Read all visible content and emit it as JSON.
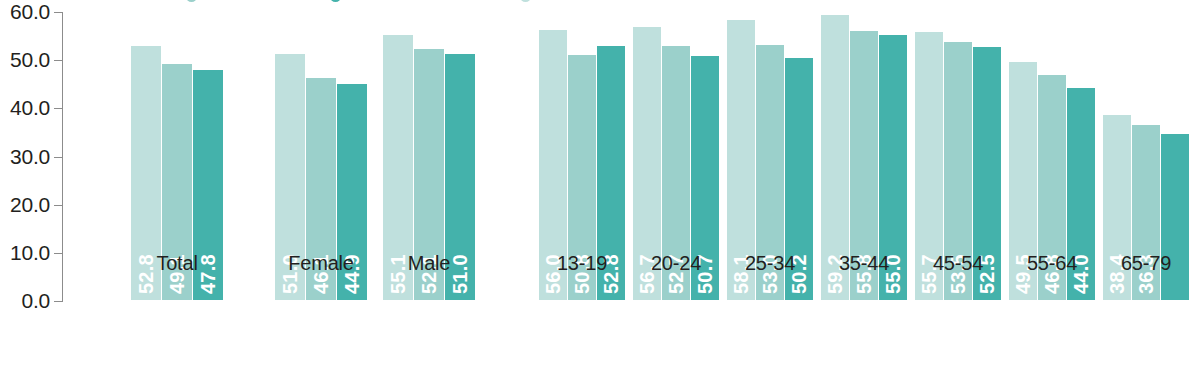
{
  "chart_data": {
    "type": "bar",
    "title": "",
    "xlabel": "",
    "ylabel": "",
    "ylim": [
      0,
      60
    ],
    "grid": false,
    "legend_position": "top",
    "y_ticks": [
      "0.0",
      "10.0",
      "20.0",
      "30.0",
      "40.0",
      "50.0",
      "60.0"
    ],
    "y_tick_values": [
      0,
      10,
      20,
      30,
      40,
      50,
      60
    ],
    "categories": [
      "Total",
      "Female",
      "Male",
      "13-19",
      "20-24",
      "25-34",
      "35-44",
      "45-54",
      "55-64",
      "65-79"
    ],
    "series": [
      {
        "name": "series-1",
        "color": "#bfe0dd",
        "values": [
          52.8,
          51.0,
          55.1,
          56.0,
          56.7,
          58.1,
          59.2,
          55.7,
          49.5,
          38.4
        ],
        "labels": [
          "52.8",
          "51.0",
          "55.1",
          "56.0",
          "56.7",
          "58.1",
          "59.2",
          "55.7",
          "49.5",
          "38.4"
        ]
      },
      {
        "name": "series-2",
        "color": "#9bd0cb",
        "values": [
          49.1,
          46.1,
          52.1,
          50.8,
          52.7,
          53.0,
          55.8,
          53.5,
          46.8,
          36.3
        ],
        "labels": [
          "49.1",
          "46.1",
          "52.1",
          "50.8",
          "52.7",
          "53.0",
          "55.8",
          "53.5",
          "46.8",
          "36.3"
        ]
      },
      {
        "name": "series-3",
        "color": "#44b2ab",
        "values": [
          47.8,
          44.9,
          51.0,
          52.8,
          50.7,
          50.2,
          55.0,
          52.5,
          44.0,
          34.4
        ],
        "labels": [
          "47.8",
          "44.9",
          "51.0",
          "52.8",
          "50.7",
          "50.2",
          "55.0",
          "52.5",
          "44.0",
          ""
        ]
      }
    ]
  },
  "axis": {
    "line_color": "#8c8c8c",
    "tick_color": "#8c8c8c"
  },
  "legend": {
    "entries": [
      {
        "label": "",
        "color": "#9bd0cb"
      },
      {
        "label": "",
        "color": "#44b2ab"
      },
      {
        "label": "",
        "color": "#bfe0dd"
      }
    ]
  }
}
